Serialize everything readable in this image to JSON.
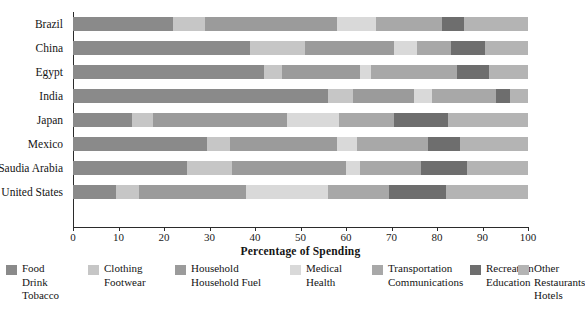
{
  "chart_data": {
    "type": "bar",
    "orientation": "horizontal",
    "stacked": true,
    "normalized": true,
    "title": "",
    "xlabel": "Percentage of Spending",
    "ylabel": "",
    "xlim": [
      0,
      100
    ],
    "grid": false,
    "legend_position": "bottom",
    "xticks": [
      0,
      10,
      20,
      30,
      40,
      50,
      60,
      70,
      80,
      90,
      100
    ],
    "xtick_labels": [
      "0",
      "10",
      "20",
      "30",
      "40",
      "50",
      "60",
      "70",
      "80",
      "90",
      "100"
    ],
    "categories": [
      "Brazil",
      "China",
      "Egypt",
      "India",
      "Japan",
      "Mexico",
      "Saudia Arabia",
      "United States"
    ],
    "series": [
      {
        "name": "Food Drink Tobacco",
        "legend_lines": [
          "Food",
          "Drink",
          "Tobacco"
        ],
        "color": "#8a8a8a",
        "values": [
          22,
          39,
          42,
          56,
          13,
          29.5,
          25,
          9.5
        ]
      },
      {
        "name": "Clothing Footwear",
        "legend_lines": [
          "Clothing",
          "Footwear"
        ],
        "color": "#c6c6c6",
        "values": [
          7,
          12,
          4,
          5.5,
          4.5,
          5,
          10,
          5
        ]
      },
      {
        "name": "Household Household Fuel",
        "legend_lines": [
          "Household",
          "Household Fuel"
        ],
        "color": "#9b9b9b",
        "values": [
          29,
          19.5,
          17,
          13.5,
          29.5,
          23.5,
          25,
          23.5
        ]
      },
      {
        "name": "Medical Health",
        "legend_lines": [
          "Medical",
          "Health"
        ],
        "color": "#d9d9d9",
        "values": [
          8.5,
          5,
          2.5,
          4,
          11.5,
          4.5,
          3,
          18
        ]
      },
      {
        "name": "Transportation Communications",
        "legend_lines": [
          "Transportation",
          "Communications"
        ],
        "color": "#a8a8a8",
        "values": [
          14.5,
          7.5,
          19,
          14,
          12,
          15.5,
          13.5,
          13.5
        ]
      },
      {
        "name": "Recreation Education",
        "legend_lines": [
          "Recreation",
          "Education"
        ],
        "color": "#6e6e6e",
        "values": [
          5,
          7.5,
          7,
          3,
          12,
          7,
          10,
          12.5
        ]
      },
      {
        "name": "Other Restaurants Hotels",
        "legend_lines": [
          "Other",
          "Restaurants",
          "Hotels"
        ],
        "color": "#b4b4b4",
        "values": [
          14,
          9.5,
          8.5,
          4,
          17.5,
          15,
          13.5,
          18
        ]
      }
    ]
  },
  "axis": {
    "x_title": "Percentage of Spending"
  }
}
